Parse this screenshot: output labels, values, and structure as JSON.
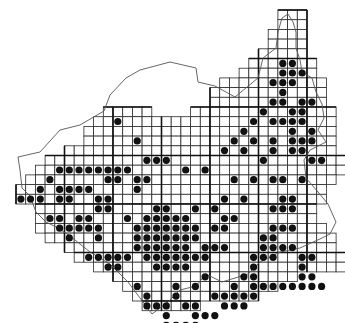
{
  "map": {
    "type": "grid-distribution-map",
    "cell_size": 9.7,
    "origin": {
      "x": 16,
      "y": 10
    },
    "colors": {
      "grid": "#2a2a2a",
      "dot": "#111111",
      "background": "#ffffff",
      "border": "#555555"
    },
    "rows": [
      {
        "r": 0,
        "c0": 27,
        "c1": 29
      },
      {
        "r": 1,
        "c0": 27,
        "c1": 29
      },
      {
        "r": 2,
        "c0": 26,
        "c1": 29
      },
      {
        "r": 3,
        "c0": 26,
        "c1": 29
      },
      {
        "r": 4,
        "c0": 25,
        "c1": 29
      },
      {
        "r": 5,
        "c0": 24,
        "c1": 30
      },
      {
        "r": 6,
        "c0": 23,
        "c1": 30
      },
      {
        "r": 7,
        "c0": 21,
        "c1": 31
      },
      {
        "r": 8,
        "c0": 20,
        "c1": 31
      },
      {
        "r": 9,
        "c0": 20,
        "c1": 31
      },
      {
        "r": 10,
        "c0": 9,
        "c1": 13
      },
      {
        "r": 10,
        "c0": 18,
        "c1": 32
      },
      {
        "r": 11,
        "c0": 8,
        "c1": 32
      },
      {
        "r": 12,
        "c0": 7,
        "c1": 32
      },
      {
        "r": 13,
        "c0": 7,
        "c1": 32
      },
      {
        "r": 14,
        "c0": 5,
        "c1": 32
      },
      {
        "r": 15,
        "c0": 3,
        "c1": 33
      },
      {
        "r": 16,
        "c0": 2,
        "c1": 33
      },
      {
        "r": 17,
        "c0": 1,
        "c1": 32
      },
      {
        "r": 18,
        "c0": 0,
        "c1": 31
      },
      {
        "r": 19,
        "c0": 0,
        "c1": 31
      },
      {
        "r": 20,
        "c0": 2,
        "c1": 30
      },
      {
        "r": 21,
        "c0": 2,
        "c1": 30
      },
      {
        "r": 22,
        "c0": 2,
        "c1": 31
      },
      {
        "r": 23,
        "c0": 3,
        "c1": 32
      },
      {
        "r": 24,
        "c0": 5,
        "c1": 32
      },
      {
        "r": 25,
        "c0": 6,
        "c1": 33
      },
      {
        "r": 26,
        "c0": 8,
        "c1": 33
      },
      {
        "r": 27,
        "c0": 10,
        "c1": 28
      },
      {
        "r": 28,
        "c0": 11,
        "c1": 26
      },
      {
        "r": 29,
        "c0": 12,
        "c1": 24
      },
      {
        "r": 30,
        "c0": 13,
        "c1": 18
      }
    ],
    "dots": [
      [
        26,
        14
      ],
      [
        27,
        17
      ],
      [
        29,
        17
      ],
      [
        30,
        17
      ],
      [
        28,
        19
      ],
      [
        29,
        19
      ],
      [
        30,
        19
      ],
      [
        25,
        22
      ],
      [
        28,
        21
      ],
      [
        26,
        25
      ],
      [
        27,
        25
      ],
      [
        31,
        25
      ],
      [
        28,
        27
      ],
      [
        28,
        28
      ],
      [
        31,
        27
      ],
      [
        31,
        28
      ],
      [
        32,
        28
      ],
      [
        29,
        31
      ],
      [
        31,
        31
      ],
      [
        32,
        31
      ],
      [
        33,
        33
      ],
      [
        27,
        35
      ],
      [
        22,
        29
      ],
      [
        24,
        34
      ],
      [
        22,
        38
      ],
      [
        26,
        38
      ],
      [
        18,
        36
      ],
      [
        19,
        27
      ],
      [
        20,
        33
      ],
      [
        21,
        39
      ],
      [
        31,
        41
      ],
      [
        33,
        40
      ],
      [
        34,
        38
      ],
      [
        28,
        23
      ],
      [
        12,
        13
      ],
      [
        21,
        25
      ]
    ],
    "cells": [
      [
        27,
        5
      ],
      [
        28,
        5
      ],
      [
        27,
        6
      ],
      [
        28,
        6
      ],
      [
        29,
        6
      ],
      [
        26,
        7
      ],
      [
        27,
        7
      ],
      [
        28,
        7
      ],
      [
        27,
        8
      ],
      [
        26,
        9
      ],
      [
        27,
        9
      ],
      [
        29,
        9
      ],
      [
        30,
        9
      ],
      [
        25,
        10
      ],
      [
        28,
        10
      ],
      [
        29,
        10
      ],
      [
        24,
        11
      ],
      [
        26,
        11
      ],
      [
        27,
        11
      ],
      [
        28,
        11
      ],
      [
        29,
        11
      ],
      [
        23,
        12
      ],
      [
        28,
        12
      ],
      [
        30,
        12
      ],
      [
        22,
        13
      ],
      [
        24,
        13
      ],
      [
        26,
        13
      ],
      [
        28,
        13
      ],
      [
        29,
        13
      ],
      [
        30,
        13
      ],
      [
        21,
        14
      ],
      [
        23,
        14
      ],
      [
        26,
        14
      ],
      [
        28,
        14
      ],
      [
        29,
        14
      ],
      [
        25,
        15
      ],
      [
        30,
        15
      ],
      [
        31,
        15
      ],
      [
        13,
        15
      ],
      [
        14,
        15
      ],
      [
        15,
        15
      ],
      [
        10,
        11
      ],
      [
        12,
        13
      ],
      [
        11,
        16
      ],
      [
        17,
        16
      ],
      [
        19,
        16
      ],
      [
        4,
        16
      ],
      [
        5,
        16
      ],
      [
        6,
        16
      ],
      [
        7,
        16
      ],
      [
        8,
        16
      ],
      [
        9,
        16
      ],
      [
        10,
        16
      ],
      [
        11,
        16
      ],
      [
        9,
        17
      ],
      [
        10,
        17
      ],
      [
        22,
        17
      ],
      [
        24,
        17
      ],
      [
        26,
        17
      ],
      [
        27,
        17
      ],
      [
        29,
        17
      ],
      [
        3,
        17
      ],
      [
        12,
        17
      ],
      [
        13,
        17
      ],
      [
        4,
        18
      ],
      [
        5,
        18
      ],
      [
        6,
        18
      ],
      [
        7,
        18
      ],
      [
        12,
        18
      ],
      [
        2,
        18
      ],
      [
        1,
        19
      ],
      [
        2,
        19
      ],
      [
        4,
        19
      ],
      [
        5,
        19
      ],
      [
        8,
        19
      ],
      [
        9,
        19
      ],
      [
        21,
        19
      ],
      [
        23,
        19
      ],
      [
        27,
        19
      ],
      [
        28,
        19
      ],
      [
        0,
        19
      ],
      [
        8,
        20
      ],
      [
        9,
        20
      ],
      [
        14,
        20
      ],
      [
        15,
        20
      ],
      [
        18,
        20
      ],
      [
        20,
        20
      ],
      [
        26,
        20
      ],
      [
        27,
        20
      ],
      [
        28,
        20
      ],
      [
        3,
        21
      ],
      [
        4,
        21
      ],
      [
        6,
        21
      ],
      [
        7,
        21
      ],
      [
        11,
        21
      ],
      [
        13,
        21
      ],
      [
        14,
        21
      ],
      [
        15,
        21
      ],
      [
        16,
        21
      ],
      [
        17,
        21
      ],
      [
        21,
        21
      ],
      [
        22,
        21
      ],
      [
        4,
        22
      ],
      [
        5,
        22
      ],
      [
        6,
        22
      ],
      [
        7,
        22
      ],
      [
        8,
        22
      ],
      [
        12,
        22
      ],
      [
        13,
        22
      ],
      [
        14,
        22
      ],
      [
        15,
        22
      ],
      [
        16,
        22
      ],
      [
        17,
        22
      ],
      [
        18,
        22
      ],
      [
        20,
        22
      ],
      [
        21,
        22
      ],
      [
        26,
        22
      ],
      [
        27,
        22
      ],
      [
        28,
        22
      ],
      [
        5,
        23
      ],
      [
        8,
        23
      ],
      [
        12,
        23
      ],
      [
        13,
        23
      ],
      [
        14,
        23
      ],
      [
        15,
        23
      ],
      [
        16,
        23
      ],
      [
        17,
        23
      ],
      [
        18,
        23
      ],
      [
        25,
        23
      ],
      [
        26,
        23
      ],
      [
        12,
        24
      ],
      [
        13,
        24
      ],
      [
        14,
        24
      ],
      [
        15,
        24
      ],
      [
        16,
        24
      ],
      [
        17,
        24
      ],
      [
        19,
        24
      ],
      [
        20,
        24
      ],
      [
        21,
        24
      ],
      [
        25,
        24
      ],
      [
        26,
        24
      ],
      [
        27,
        24
      ],
      [
        28,
        24
      ],
      [
        7,
        25
      ],
      [
        8,
        25
      ],
      [
        9,
        25
      ],
      [
        10,
        25
      ],
      [
        11,
        25
      ],
      [
        13,
        25
      ],
      [
        14,
        25
      ],
      [
        15,
        25
      ],
      [
        16,
        25
      ],
      [
        17,
        25
      ],
      [
        18,
        25
      ],
      [
        19,
        25
      ],
      [
        24,
        25
      ],
      [
        25,
        25
      ],
      [
        26,
        25
      ],
      [
        29,
        25
      ],
      [
        30,
        25
      ],
      [
        9,
        26
      ],
      [
        10,
        26
      ],
      [
        14,
        26
      ],
      [
        15,
        26
      ],
      [
        16,
        26
      ],
      [
        17,
        26
      ],
      [
        24,
        26
      ],
      [
        29,
        26
      ],
      [
        19,
        27
      ],
      [
        23,
        27
      ],
      [
        24,
        27
      ],
      [
        29,
        27
      ],
      [
        30,
        27
      ],
      [
        12,
        28
      ],
      [
        16,
        28
      ],
      [
        18,
        28
      ],
      [
        22,
        28
      ],
      [
        24,
        28
      ],
      [
        25,
        28
      ],
      [
        26,
        28
      ],
      [
        27,
        28
      ],
      [
        28,
        28
      ],
      [
        29,
        28
      ],
      [
        30,
        28
      ],
      [
        31,
        28
      ],
      [
        13,
        29
      ],
      [
        16,
        29
      ],
      [
        20,
        29
      ],
      [
        21,
        29
      ],
      [
        22,
        29
      ],
      [
        23,
        29
      ],
      [
        24,
        29
      ],
      [
        13,
        30
      ],
      [
        14,
        30
      ],
      [
        15,
        30
      ],
      [
        17,
        30
      ],
      [
        18,
        30
      ],
      [
        21,
        30
      ],
      [
        22,
        30
      ],
      [
        23,
        30
      ],
      [
        15,
        31
      ],
      [
        18,
        31
      ],
      [
        19,
        31
      ],
      [
        20,
        31
      ],
      [
        15,
        32
      ],
      [
        16,
        32
      ],
      [
        17,
        32
      ],
      [
        18,
        32
      ],
      [
        17,
        33
      ],
      [
        18,
        33
      ]
    ]
  }
}
